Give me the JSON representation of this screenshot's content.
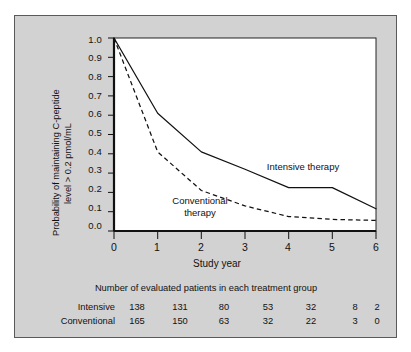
{
  "figure": {
    "background_color": "#d2d2d2",
    "plot_background_color": "#ffffff",
    "border_color": "#5a5a5a"
  },
  "chart_data": {
    "type": "line",
    "title": "",
    "xlabel": "Study year",
    "ylabel": "Probability of maintaining C-peptide level > 0.2 pmol/mL",
    "ylabel_line1": "Probability of maintaining C-peptide",
    "ylabel_line2": "level > 0.2 pmol/mL",
    "x": [
      0,
      1,
      2,
      3,
      4,
      5,
      6
    ],
    "xlim": [
      0,
      6
    ],
    "ylim": [
      0.0,
      1.0
    ],
    "xticks": [
      "0",
      "1",
      "2",
      "3",
      "4",
      "5",
      "6"
    ],
    "yticks": [
      "1.0",
      "0.9",
      "0.8",
      "0.7",
      "0.6",
      "0.5",
      "0.4",
      "0.3",
      "0.2",
      "0.1",
      "0.0"
    ],
    "grid": false,
    "legend_position": "inline-annotation",
    "series": [
      {
        "name": "Intensive therapy",
        "style": "solid",
        "color": "#111111",
        "values": [
          1.0,
          0.61,
          0.41,
          0.32,
          0.225,
          0.225,
          0.115
        ],
        "label_text": "Intensive therapy"
      },
      {
        "name": "Conventional therapy",
        "style": "dashed",
        "color": "#111111",
        "values": [
          1.0,
          0.41,
          0.21,
          0.13,
          0.075,
          0.06,
          0.055
        ],
        "label_line1": "Conventional",
        "label_line2": "therapy"
      }
    ]
  },
  "table": {
    "caption": "Number of evaluated patients in each treatment group",
    "rows": [
      {
        "label": "Intensive",
        "values": [
          "138",
          "131",
          "80",
          "53",
          "32",
          "8",
          "2"
        ]
      },
      {
        "label": "Conventional",
        "values": [
          "165",
          "150",
          "63",
          "32",
          "22",
          "3",
          "0"
        ]
      }
    ]
  }
}
